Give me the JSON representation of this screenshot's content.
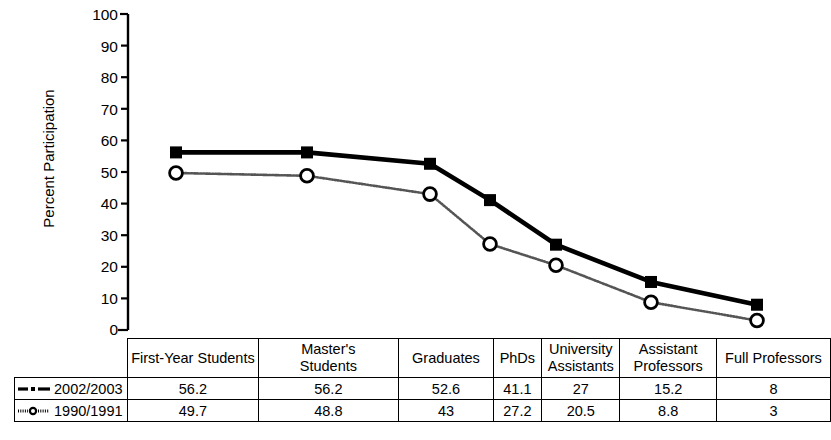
{
  "chart_data": {
    "type": "line",
    "title": "",
    "xlabel": "",
    "ylabel": "Percent Participation",
    "ylim": [
      0,
      100
    ],
    "yticks": [
      0,
      10,
      20,
      30,
      40,
      50,
      60,
      70,
      80,
      90,
      100
    ],
    "grid": false,
    "legend_position": "table-left-column",
    "categories": [
      "First-Year Students",
      "Master's Students",
      "Graduates",
      "PhDs",
      "University Assistants",
      "Assistant Professors",
      "Full Professors"
    ],
    "series": [
      {
        "name": "2002/2003",
        "marker": "filled-square",
        "line_style": "solid-thick",
        "color": "#000000",
        "values": [
          56.2,
          56.2,
          52.6,
          41.1,
          27,
          15.2,
          8
        ],
        "value_labels": [
          "56.2",
          "56.2",
          "52.6",
          "41.1",
          "27",
          "15.2",
          "8"
        ]
      },
      {
        "name": "1990/1991",
        "marker": "open-circle",
        "line_style": "dotted-thin",
        "color": "#4a4a4a",
        "values": [
          49.7,
          48.8,
          43,
          27.2,
          20.5,
          8.8,
          3
        ],
        "value_labels": [
          "49.7",
          "48.8",
          "43",
          "27.2",
          "20.5",
          "8.8",
          "3"
        ]
      }
    ]
  },
  "table": {
    "corner_label": "",
    "column_headers": [
      "First-Year Students",
      "Master's\nStudents",
      "Graduates",
      "PhDs",
      "University\nAssistants",
      "Assistant\nProfessors",
      "Full Professors"
    ],
    "column_headers_lines": [
      [
        "First-Year Students"
      ],
      [
        "Master's",
        "Students"
      ],
      [
        "Graduates"
      ],
      [
        "PhDs"
      ],
      [
        "University",
        "Assistants"
      ],
      [
        "Assistant",
        "Professors"
      ],
      [
        "Full Professors"
      ]
    ],
    "rows": [
      {
        "legend": "2002/2003",
        "marker": "filled-square",
        "line_style": "dash-dot",
        "cells": [
          "56.2",
          "56.2",
          "52.6",
          "41.1",
          "27",
          "15.2",
          "8"
        ]
      },
      {
        "legend": "1990/1991",
        "marker": "open-circle",
        "line_style": "dotted",
        "cells": [
          "49.7",
          "48.8",
          "43",
          "27.2",
          "20.5",
          "8.8",
          "3"
        ]
      }
    ]
  },
  "axis": {
    "y_title": "Percent Participation",
    "y_labels": [
      "100",
      "90",
      "80",
      "70",
      "60",
      "50",
      "40",
      "30",
      "20",
      "10",
      "0"
    ]
  }
}
